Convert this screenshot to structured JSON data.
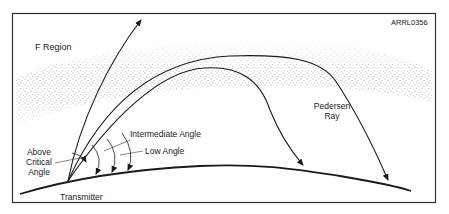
{
  "figure": {
    "id_label": "ARRL0356",
    "region_label": "F Region",
    "labels": {
      "above_critical": [
        "Above",
        "Critical",
        "Angle"
      ],
      "intermediate_angle": "Intermediate Angle",
      "low_angle": "Low Angle",
      "pedersen": [
        "Pedersen",
        "Ray"
      ],
      "transmitter": "Transmitter"
    },
    "rays": [
      {
        "name": "above-critical-angle-ray",
        "behavior": "escapes through F region"
      },
      {
        "name": "intermediate-angle-ray",
        "behavior": "refracted back to earth (shorter hop)"
      },
      {
        "name": "low-angle-pedersen-ray",
        "behavior": "travels along F region then returns (longer hop)"
      }
    ],
    "colors": {
      "line": "#1a1a1a",
      "stipple": "#555555",
      "frame": "#333333",
      "background": "#ffffff"
    }
  }
}
